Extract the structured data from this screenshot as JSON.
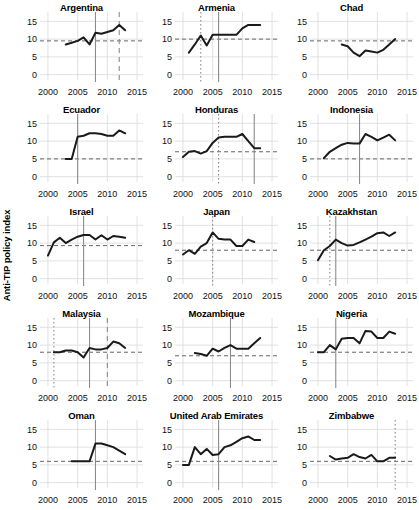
{
  "figure": {
    "ylabel": "Anti-TIP policy index",
    "y_ticks": [
      "0",
      "5",
      "10",
      "15"
    ],
    "y_tick_values": [
      0,
      5,
      10,
      15
    ],
    "x_ticks": [
      "2000",
      "2005",
      "2010",
      "2015"
    ],
    "x_tick_values": [
      2000,
      2005,
      2010,
      2015
    ],
    "line_color": "#1a1a1a",
    "grid_color": "#d9d9d9",
    "ref_line_color": "#666666",
    "marker_line_color": "#8c8c8c",
    "background": "#ffffff"
  },
  "chart_data": {
    "type": "line",
    "title": "",
    "xlabel": "",
    "ylabel": "Anti-TIP policy index",
    "xlim": [
      1999,
      2016
    ],
    "ylim": [
      -1.5,
      16.5
    ],
    "grid": true,
    "legend": "none",
    "layout": {
      "rows": 5,
      "cols": 3
    },
    "panels": [
      {
        "name": "Argentina",
        "x": [
          2003,
          2004,
          2005,
          2006,
          2007,
          2008,
          2009,
          2010,
          2011,
          2012,
          2013
        ],
        "y": [
          8.5,
          9.0,
          9.5,
          10.5,
          8.5,
          11.8,
          11.5,
          12.0,
          12.5,
          14.0,
          12.5
        ],
        "hline": 9.5,
        "vlines": [
          {
            "x": 2008,
            "style": "solid"
          },
          {
            "x": 2012,
            "style": "dashed"
          }
        ]
      },
      {
        "name": "Armenia",
        "x": [
          2001,
          2002,
          2003,
          2004,
          2005,
          2006,
          2007,
          2008,
          2009,
          2010,
          2011,
          2012,
          2013
        ],
        "y": [
          6.2,
          8.5,
          11.0,
          8.2,
          11.2,
          11.2,
          11.2,
          11.2,
          11.2,
          13.0,
          14.0,
          14.0,
          14.0
        ],
        "hline": 10.0,
        "vlines": [
          {
            "x": 2003,
            "style": "dotted"
          },
          {
            "x": 2006,
            "style": "solid"
          }
        ]
      },
      {
        "name": "Chad",
        "x": [
          2004,
          2005,
          2006,
          2007,
          2008,
          2009,
          2010,
          2011,
          2012,
          2013
        ],
        "y": [
          8.5,
          8.0,
          6.2,
          5.2,
          6.8,
          6.5,
          6.2,
          7.0,
          8.5,
          10.0
        ],
        "hline": 9.5,
        "vlines": []
      },
      {
        "name": "Ecuador",
        "x": [
          2003,
          2004,
          2005,
          2006,
          2007,
          2008,
          2009,
          2010,
          2011,
          2012,
          2013
        ],
        "y": [
          5.0,
          5.0,
          11.2,
          11.5,
          12.2,
          12.2,
          12.0,
          11.5,
          11.5,
          13.0,
          12.2
        ],
        "hline": 5.0,
        "vlines": [
          {
            "x": 2005,
            "style": "solid"
          }
        ]
      },
      {
        "name": "Honduras",
        "x": [
          2000,
          2001,
          2002,
          2003,
          2004,
          2005,
          2006,
          2007,
          2008,
          2009,
          2010,
          2011,
          2012,
          2013
        ],
        "y": [
          5.5,
          7.0,
          7.2,
          6.5,
          7.2,
          9.5,
          11.0,
          11.2,
          11.2,
          11.2,
          12.0,
          10.0,
          8.0,
          8.0
        ],
        "hline": 7.0,
        "vlines": [
          {
            "x": 2006,
            "style": "dotted"
          },
          {
            "x": 2012,
            "style": "solid"
          }
        ]
      },
      {
        "name": "Indonesia",
        "x": [
          2001,
          2002,
          2003,
          2004,
          2005,
          2006,
          2007,
          2008,
          2009,
          2010,
          2011,
          2012,
          2013
        ],
        "y": [
          5.2,
          7.0,
          8.0,
          9.0,
          9.5,
          9.3,
          9.3,
          12.0,
          11.2,
          10.2,
          11.0,
          11.8,
          10.2
        ],
        "hline": 5.0,
        "vlines": [
          {
            "x": 2007,
            "style": "solid"
          }
        ]
      },
      {
        "name": "Israel",
        "x": [
          2000,
          2001,
          2002,
          2003,
          2004,
          2005,
          2006,
          2007,
          2008,
          2009,
          2010,
          2011,
          2012,
          2013
        ],
        "y": [
          6.5,
          10.2,
          11.5,
          10.0,
          11.0,
          11.8,
          12.3,
          12.3,
          11.0,
          12.2,
          11.0,
          12.0,
          11.8,
          11.5
        ],
        "hline": 9.3,
        "vlines": [
          {
            "x": 2006,
            "style": "solid"
          }
        ]
      },
      {
        "name": "Japan",
        "x": [
          2000,
          2001,
          2002,
          2003,
          2004,
          2005,
          2006,
          2007,
          2008,
          2009,
          2010,
          2011,
          2012
        ],
        "y": [
          6.8,
          8.0,
          7.0,
          9.0,
          10.0,
          13.0,
          11.2,
          11.0,
          11.0,
          9.2,
          9.2,
          11.0,
          10.3
        ],
        "hline": 8.0,
        "vlines": [
          {
            "x": 2005,
            "style": "dotted"
          }
        ]
      },
      {
        "name": "Kazakhstan",
        "x": [
          2000,
          2001,
          2002,
          2003,
          2004,
          2005,
          2006,
          2007,
          2008,
          2009,
          2010,
          2011,
          2012,
          2013
        ],
        "y": [
          5.2,
          8.0,
          9.2,
          11.0,
          10.0,
          9.3,
          9.5,
          10.2,
          11.0,
          11.8,
          12.8,
          13.0,
          12.0,
          13.0
        ],
        "hline": 8.0,
        "vlines": [
          {
            "x": 2002,
            "style": "dotted"
          },
          {
            "x": 2003,
            "style": "solid"
          }
        ]
      },
      {
        "name": "Malaysia",
        "x": [
          2001,
          2002,
          2003,
          2004,
          2005,
          2006,
          2007,
          2008,
          2009,
          2010,
          2011,
          2012,
          2013
        ],
        "y": [
          8.0,
          8.0,
          8.5,
          8.5,
          8.0,
          6.5,
          9.2,
          8.8,
          8.8,
          9.2,
          11.0,
          10.5,
          9.2
        ],
        "hline": 8.0,
        "vlines": [
          {
            "x": 2001,
            "style": "dotted"
          },
          {
            "x": 2007,
            "style": "solid"
          },
          {
            "x": 2010,
            "style": "dashed"
          }
        ]
      },
      {
        "name": "Mozambique",
        "x": [
          2002,
          2003,
          2004,
          2005,
          2006,
          2007,
          2008,
          2009,
          2010,
          2011,
          2012,
          2013
        ],
        "y": [
          7.8,
          7.5,
          7.0,
          9.0,
          8.2,
          9.2,
          10.0,
          9.0,
          9.0,
          9.0,
          10.5,
          12.0
        ],
        "hline": 7.0,
        "vlines": [
          {
            "x": 2008,
            "style": "solid"
          }
        ]
      },
      {
        "name": "Nigeria",
        "x": [
          2000,
          2001,
          2002,
          2003,
          2004,
          2005,
          2006,
          2007,
          2008,
          2009,
          2010,
          2011,
          2012,
          2013
        ],
        "y": [
          8.0,
          8.0,
          10.0,
          8.8,
          11.8,
          12.0,
          12.0,
          10.5,
          14.0,
          13.8,
          12.0,
          12.0,
          13.8,
          13.2
        ],
        "hline": 8.0,
        "vlines": [
          {
            "x": 2003,
            "style": "solid"
          }
        ]
      },
      {
        "name": "Oman",
        "x": [
          2004,
          2005,
          2006,
          2007,
          2008,
          2009,
          2010,
          2011,
          2012,
          2013
        ],
        "y": [
          6.0,
          6.0,
          6.0,
          6.0,
          11.0,
          11.0,
          10.5,
          10.0,
          9.0,
          8.0
        ],
        "hline": 6.0,
        "vlines": [
          {
            "x": 2008,
            "style": "solid"
          }
        ]
      },
      {
        "name": "United Arab Emirates",
        "x": [
          2000,
          2001,
          2002,
          2003,
          2004,
          2005,
          2006,
          2007,
          2008,
          2009,
          2010,
          2011,
          2012,
          2013
        ],
        "y": [
          5.0,
          5.0,
          10.0,
          8.0,
          9.5,
          7.8,
          8.0,
          10.0,
          10.5,
          11.5,
          12.5,
          13.0,
          12.0,
          12.0
        ],
        "hline": 6.0,
        "vlines": [
          {
            "x": 2006,
            "style": "solid"
          }
        ]
      },
      {
        "name": "Zimbabwe",
        "x": [
          2002,
          2003,
          2004,
          2005,
          2006,
          2007,
          2008,
          2009,
          2010,
          2011,
          2012,
          2013
        ],
        "y": [
          7.5,
          6.5,
          6.8,
          7.0,
          8.0,
          7.2,
          6.8,
          7.8,
          6.0,
          6.0,
          7.0,
          7.0
        ],
        "hline": 6.0,
        "vlines": [
          {
            "x": 2013,
            "style": "dotted"
          }
        ]
      }
    ]
  }
}
